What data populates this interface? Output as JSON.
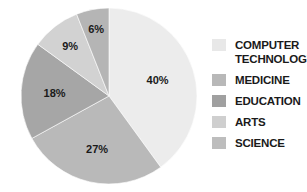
{
  "chart_data": {
    "type": "pie",
    "title": "",
    "categories": [
      "COMPUTER TECHNOLOGY",
      "MEDICINE",
      "EDUCATION",
      "ARTS",
      "SCIENCE"
    ],
    "values": [
      40,
      27,
      18,
      9,
      6
    ],
    "labels": [
      "40%",
      "27%",
      "18%",
      "9%",
      "6%"
    ],
    "colors": [
      "#ececec",
      "#b9b9b9",
      "#a6a6a6",
      "#d2d2d2",
      "#b5b5b5"
    ],
    "start_angle": "12 o'clock",
    "direction": "clockwise",
    "legend_position": "right"
  },
  "legend": {
    "items": [
      {
        "label": "COMPUTER TECHNOLOGY",
        "color": "#e8e8e8"
      },
      {
        "label": "MEDICINE",
        "color": "#b8b8b8"
      },
      {
        "label": "EDUCATION",
        "color": "#a0a0a0"
      },
      {
        "label": "ARTS",
        "color": "#cfcfcf"
      },
      {
        "label": "SCIENCE",
        "color": "#bdbdbd"
      }
    ]
  }
}
